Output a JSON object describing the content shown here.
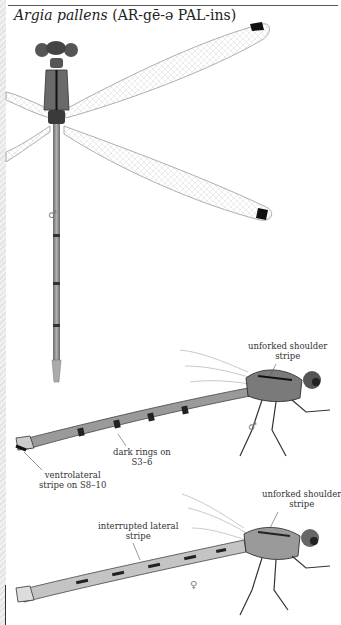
{
  "header": {
    "section_title": "Amethyst Dancer",
    "species_scientific": "Argia pallens",
    "pronunciation": "(AR-gē-ə PAL-ins)"
  },
  "figures": [
    {
      "id": "male-dorsal",
      "view": "dorsal",
      "sex_symbol": "♂"
    },
    {
      "id": "male-lateral",
      "view": "lateral",
      "sex_symbol": "♂",
      "labels": [
        {
          "text_line1": "unforked shoulder",
          "text_line2": "stripe"
        },
        {
          "text_line1": "dark rings on",
          "text_line2": "S3–6"
        },
        {
          "text_line1": "ventrolateral",
          "text_line2": "stripe on S8–10"
        }
      ]
    },
    {
      "id": "female-lateral",
      "view": "lateral",
      "sex_symbol": "♀",
      "labels": [
        {
          "text_line1": "unforked shoulder",
          "text_line2": "stripe"
        },
        {
          "text_line1": "interrupted lateral",
          "text_line2": "stripe"
        }
      ]
    }
  ],
  "colors": {
    "body": "#8a8a8a",
    "dark_marking": "#222222",
    "wing_vein": "#b5b5b5",
    "pterostigma": "#111111"
  }
}
